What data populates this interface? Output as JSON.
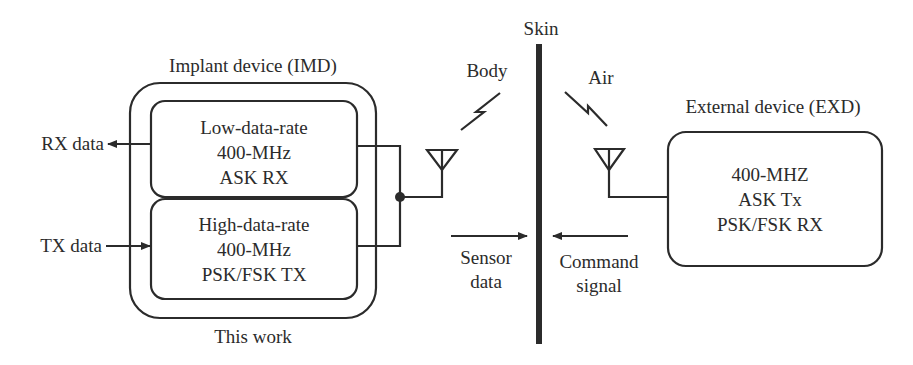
{
  "skin": {
    "label": "Skin"
  },
  "media": {
    "body": "Body",
    "air": "Air"
  },
  "imd": {
    "title": "Implant device (IMD)",
    "caption": "This work",
    "rx_block": {
      "lines": [
        "Low-data-rate",
        "400-MHz",
        "ASK RX"
      ]
    },
    "tx_block": {
      "lines": [
        "High-data-rate",
        "400-MHz",
        "PSK/FSK TX"
      ]
    },
    "rx_data": "RX data",
    "tx_data": "TX data"
  },
  "exd": {
    "title": "External device (EXD)",
    "lines": [
      "400-MHZ",
      "ASK Tx",
      "PSK/FSK RX"
    ]
  },
  "arrows": {
    "sensor": [
      "Sensor",
      "data"
    ],
    "command": [
      "Command",
      "signal"
    ]
  },
  "colors": {
    "ink": "#2b2b2b",
    "background": "#ffffff"
  }
}
